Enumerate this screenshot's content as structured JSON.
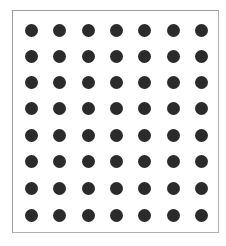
{
  "grid": {
    "rows": 8,
    "cols": 7,
    "dot_color": "#2b2b2b",
    "frame_color": "#9a9a9a",
    "col_centers": [
      31,
      59,
      88,
      116,
      144,
      173,
      201
    ],
    "row_centers": [
      30,
      56,
      82,
      108,
      135,
      161,
      188,
      215
    ],
    "dot_diameter": 13
  }
}
